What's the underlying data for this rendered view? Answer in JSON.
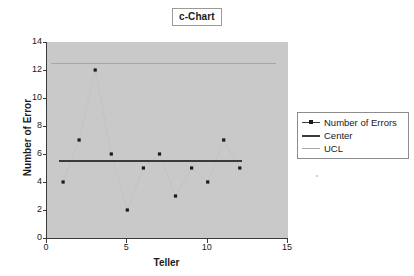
{
  "chart_data": {
    "type": "scatter",
    "title": "c-Chart",
    "xlabel": "Teller",
    "ylabel": "Number of Error",
    "x": [
      1,
      2,
      3,
      4,
      5,
      6,
      7,
      8,
      9,
      10,
      11,
      12
    ],
    "categories": [
      "1",
      "2",
      "3",
      "4",
      "5",
      "6",
      "7",
      "8",
      "9",
      "10",
      "11",
      "12"
    ],
    "series": [
      {
        "name": "Number of Errors",
        "values": [
          4,
          7,
          12,
          6,
          2,
          5,
          6,
          3,
          5,
          4,
          7,
          5
        ],
        "color": "#1a1a1a",
        "marker": "dot"
      },
      {
        "name": "Center",
        "value": 5.5,
        "values": [
          5.5,
          5.5,
          5.5,
          5.5,
          5.5,
          5.5,
          5.5,
          5.5,
          5.5,
          5.5,
          5.5,
          5.5
        ],
        "color": "#3a3a3a",
        "style": "solid-thick"
      },
      {
        "name": "UCL",
        "value": 12.5,
        "values": [
          12.5,
          12.5,
          12.5,
          12.5,
          12.5,
          12.5,
          12.5,
          12.5,
          12.5,
          12.5,
          12.5,
          12.5
        ],
        "color": "#a7a7a7",
        "style": "solid-thin"
      }
    ],
    "xlim": [
      0,
      15
    ],
    "ylim": [
      0,
      14
    ],
    "xticks": [
      0,
      5,
      10,
      15
    ],
    "yticks": [
      0,
      2,
      4,
      6,
      8,
      10,
      12,
      14
    ],
    "xtick_labels": [
      "0",
      "5",
      "10",
      "15"
    ],
    "ytick_labels": [
      "0",
      "2",
      "4",
      "6",
      "8",
      "10",
      "12",
      "14"
    ],
    "grid": false,
    "legend_position": "right",
    "plot_background": "#c9c9c9",
    "figure_background": "#ffffff"
  },
  "legend": {
    "entries": [
      {
        "label": "Number of Errors",
        "key": "line-with-marker"
      },
      {
        "label": "Center",
        "key": "thick-line"
      },
      {
        "label": "UCL",
        "key": "thin-line"
      }
    ]
  }
}
